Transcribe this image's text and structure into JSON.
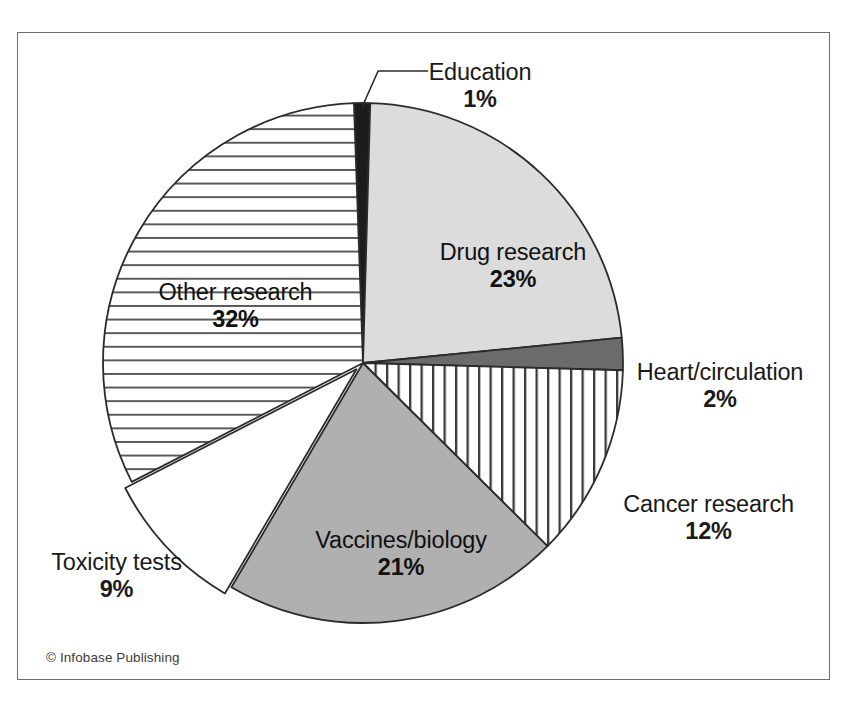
{
  "figure": {
    "credit": "© Infobase Publishing",
    "border_color": "#6e6e6e",
    "background": "#ffffff"
  },
  "chart_data": {
    "type": "pie",
    "title": "",
    "subtitle": "",
    "xlabel": "",
    "ylabel": "",
    "legend_position": "none",
    "labels_position": "around-and-inside",
    "start_angle_deg": -92,
    "direction": "clockwise",
    "total_percent": 100,
    "categories": [
      "Education",
      "Drug research",
      "Heart/circulation",
      "Cancer research",
      "Vaccines/biology",
      "Toxicity tests",
      "Other research"
    ],
    "values": [
      1,
      23,
      2,
      12,
      21,
      9,
      32
    ],
    "value_labels": [
      "1%",
      "23%",
      "2%",
      "12%",
      "21%",
      "9%",
      "32%"
    ],
    "slices": [
      {
        "name": "Education",
        "label": "Education",
        "percent": 1,
        "percent_label": "1%",
        "fill": "#1c1c1c",
        "pattern": "solid",
        "label_placement": "outside",
        "leader_line": true
      },
      {
        "name": "Drug research",
        "label": "Drug research",
        "percent": 23,
        "percent_label": "23%",
        "fill": "#dcdcdc",
        "pattern": "solid",
        "label_placement": "inside",
        "leader_line": false
      },
      {
        "name": "Heart/circulation",
        "label": "Heart/circulation",
        "percent": 2,
        "percent_label": "2%",
        "fill": "#6b6b6b",
        "pattern": "solid",
        "label_placement": "outside",
        "leader_line": false
      },
      {
        "name": "Cancer research",
        "label": "Cancer research",
        "percent": 12,
        "percent_label": "12%",
        "fill": "#ffffff",
        "pattern": "vertical-lines",
        "label_placement": "outside",
        "leader_line": false
      },
      {
        "name": "Vaccines/biology",
        "label": "Vaccines/biology",
        "percent": 21,
        "percent_label": "21%",
        "fill": "#b0b0b0",
        "pattern": "solid",
        "label_placement": "inside",
        "leader_line": false
      },
      {
        "name": "Toxicity tests",
        "label": "Toxicity tests",
        "percent": 9,
        "percent_label": "9%",
        "fill": "#ffffff",
        "pattern": "solid",
        "label_placement": "outside",
        "leader_line": false
      },
      {
        "name": "Other research",
        "label": "Other research",
        "percent": 32,
        "percent_label": "32%",
        "fill": "#ffffff",
        "pattern": "horizontal-lines",
        "label_placement": "inside",
        "leader_line": false
      }
    ],
    "geometry": {
      "center_x": 345,
      "center_y": 330,
      "radius": 260
    },
    "stroke_color": "#2b2b2b",
    "grid": false
  }
}
